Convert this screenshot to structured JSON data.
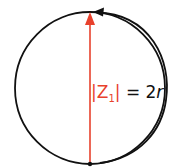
{
  "diagram": {
    "label": {
      "lhs": "|Z",
      "subscript": "1",
      "lhs_close": "|",
      "rhs": " = 2",
      "var": "r"
    },
    "colors": {
      "vector": "#e8412c",
      "circle": "#111111",
      "label_red": "#e8412c",
      "label_black": "#111111"
    }
  }
}
